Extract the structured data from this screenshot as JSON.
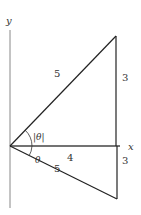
{
  "diagram": {
    "axes": {
      "x_label": "x",
      "y_label": "y"
    },
    "upper_triangle": {
      "hypotenuse_label": "5",
      "vertical_label": "3",
      "angle_label": "|θ|"
    },
    "lower_triangle": {
      "hypotenuse_label": "5",
      "vertical_label": "3",
      "angle_label": "θ"
    },
    "base_label": "4",
    "colors": {
      "line": "#222222",
      "axis": "#888888",
      "text": "#333333"
    }
  }
}
